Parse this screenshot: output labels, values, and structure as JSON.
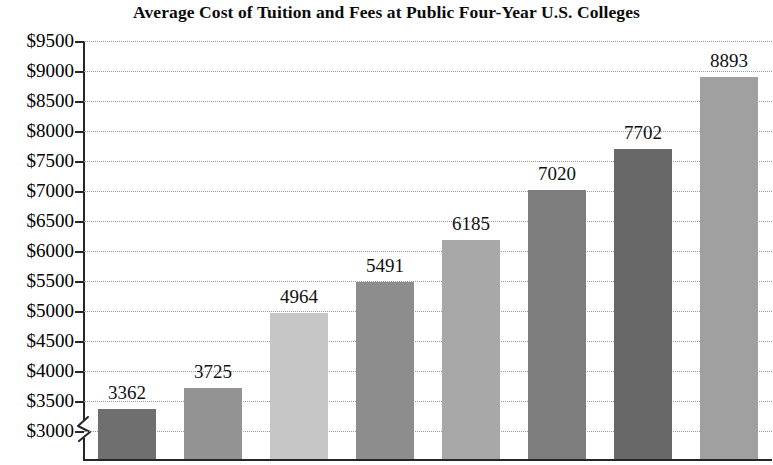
{
  "chart_data": {
    "type": "bar",
    "title": "Average Cost of Tuition and Fees at Public Four-Year U.S. Colleges",
    "xlabel": "",
    "ylabel": "",
    "categories": [
      "",
      "",
      "",
      "",
      "",
      "",
      "",
      ""
    ],
    "values": [
      3362,
      3725,
      4964,
      5491,
      6185,
      7020,
      7702,
      8893
    ],
    "data_labels": [
      "3362",
      "3725",
      "4964",
      "5491",
      "6185",
      "7020",
      "7702",
      "8893"
    ],
    "bar_colors": [
      "#6f6f6f",
      "#939393",
      "#c6c6c6",
      "#8d8d8d",
      "#a8a8a8",
      "#7d7d7d",
      "#686868",
      "#a0a0a0"
    ],
    "ylim": [
      3000,
      9500
    ],
    "ytick_values": [
      9500,
      9000,
      8500,
      8000,
      7500,
      7000,
      6500,
      6000,
      5500,
      5000,
      4500,
      4000,
      3500,
      3000
    ],
    "ytick_labels": [
      "$9500",
      "$9000",
      "$8500",
      "$8000",
      "$7500",
      "$7000",
      "$6500",
      "$6000",
      "$5500",
      "$5000",
      "$4500",
      "$4000",
      "$3500",
      "$3000"
    ],
    "grid": true,
    "grid_style": "dotted",
    "grid_color": "#9a9a9a",
    "axis_color": "#262626",
    "axis_break": true,
    "legend": false,
    "background": "#ffffff"
  }
}
